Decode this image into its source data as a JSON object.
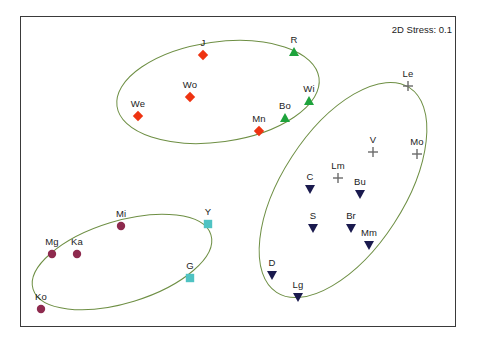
{
  "figure": {
    "stress_label": "2D Stress: 0.1",
    "frame": {
      "x": 20,
      "y": 16,
      "width": 436,
      "height": 311,
      "border_color": "#3a3a3a"
    },
    "background_color": "#ffffff"
  },
  "colors": {
    "red_diamond": "#ee3311",
    "green_triangle": "#1ea33c",
    "navy_triangle_down": "#1a1a4e",
    "gray_plus": "#6b6b6b",
    "maroon_circle": "#8e2a4e",
    "teal_square": "#4fc3c3",
    "ellipse_line": "#6e8f44",
    "label_text": "#1c1c1c"
  },
  "chart_data": {
    "type": "scatter",
    "title": "",
    "subtitle": "",
    "xlabel": "",
    "ylabel": "",
    "annotations": [
      "2D Stress: 0.1"
    ],
    "axes_visible": false,
    "grid": false,
    "legend_position": "none",
    "xlim": [
      20,
      456
    ],
    "ylim": [
      16,
      327
    ],
    "groups": [
      {
        "name": "red-diamonds",
        "marker": "diamond",
        "color": "#ee3311",
        "points": [
          {
            "label": "J",
            "x": 203,
            "y": 55
          },
          {
            "label": "Wo",
            "x": 190,
            "y": 97
          },
          {
            "label": "We",
            "x": 138,
            "y": 116
          },
          {
            "label": "Mn",
            "x": 259,
            "y": 131
          }
        ]
      },
      {
        "name": "green-triangles",
        "marker": "triangle-up",
        "color": "#1ea33c",
        "points": [
          {
            "label": "R",
            "x": 294,
            "y": 52
          },
          {
            "label": "Wi",
            "x": 309,
            "y": 101
          },
          {
            "label": "Bo",
            "x": 285,
            "y": 118
          }
        ]
      },
      {
        "name": "gray-plus",
        "marker": "plus",
        "color": "#6b6b6b",
        "points": [
          {
            "label": "Le",
            "x": 408,
            "y": 86
          },
          {
            "label": "V",
            "x": 373,
            "y": 152
          },
          {
            "label": "Mo",
            "x": 417,
            "y": 154
          },
          {
            "label": "Lm",
            "x": 338,
            "y": 178
          }
        ]
      },
      {
        "name": "navy-triangles-down",
        "marker": "triangle-down",
        "color": "#1a1a4e",
        "points": [
          {
            "label": "C",
            "x": 310,
            "y": 189
          },
          {
            "label": "Bu",
            "x": 360,
            "y": 194
          },
          {
            "label": "S",
            "x": 313,
            "y": 228
          },
          {
            "label": "Br",
            "x": 351,
            "y": 228
          },
          {
            "label": "Mm",
            "x": 369,
            "y": 245
          },
          {
            "label": "D",
            "x": 272,
            "y": 275
          },
          {
            "label": "Lg",
            "x": 298,
            "y": 297
          }
        ]
      },
      {
        "name": "maroon-circles",
        "marker": "circle",
        "color": "#8e2a4e",
        "points": [
          {
            "label": "Mi",
            "x": 121,
            "y": 226
          },
          {
            "label": "Mg",
            "x": 52,
            "y": 254
          },
          {
            "label": "Ka",
            "x": 77,
            "y": 254
          },
          {
            "label": "Ko",
            "x": 41,
            "y": 309
          }
        ]
      },
      {
        "name": "teal-squares",
        "marker": "square",
        "color": "#4fc3c3",
        "points": [
          {
            "label": "Y",
            "x": 208,
            "y": 224
          },
          {
            "label": "G",
            "x": 190,
            "y": 278
          }
        ]
      }
    ],
    "ellipses": [
      {
        "name": "top-cluster",
        "cx": 218,
        "cy": 92,
        "rx": 102,
        "ry": 50,
        "rotation": -8
      },
      {
        "name": "right-cluster",
        "cx": 343,
        "cy": 190,
        "rx": 122,
        "ry": 61,
        "rotation": -57
      },
      {
        "name": "bottom-left-cluster",
        "cx": 122,
        "cy": 262,
        "rx": 93,
        "ry": 41,
        "rotation": -17
      }
    ]
  }
}
